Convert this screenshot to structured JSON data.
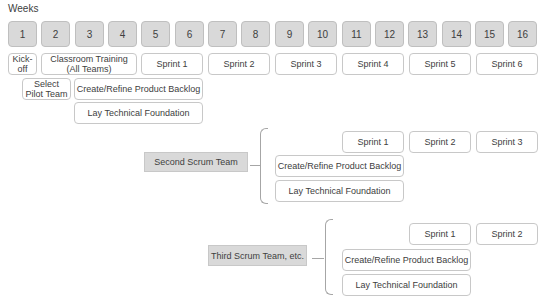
{
  "header": {
    "weeks_label": "Weeks"
  },
  "weeks": [
    "1",
    "2",
    "3",
    "4",
    "5",
    "6",
    "7",
    "8",
    "9",
    "10",
    "11",
    "12",
    "13",
    "14",
    "15",
    "16"
  ],
  "pilot_team": {
    "row1": {
      "kickoff": "Kick-\noff",
      "classroom_training": "Classroom Training\n(All Teams)",
      "sprints": [
        "Sprint 1",
        "Sprint 2",
        "Sprint 3",
        "Sprint 4",
        "Sprint 5",
        "Sprint 6"
      ]
    },
    "select_pilot_team": "Select\nPilot Team",
    "create_refine_backlog": "Create/Refine Product Backlog",
    "lay_technical_foundation": "Lay Technical Foundation"
  },
  "second_team": {
    "label": "Second Scrum Team",
    "sprints": [
      "Sprint 1",
      "Sprint 2",
      "Sprint 3"
    ],
    "create_refine_backlog": "Create/Refine Product Backlog",
    "lay_technical_foundation": "Lay Technical Foundation"
  },
  "third_team": {
    "label": "Third Scrum Team, etc.",
    "sprints": [
      "Sprint 1",
      "Sprint 2"
    ],
    "create_refine_backlog": "Create/Refine Product Backlog",
    "lay_technical_foundation": "Lay Technical Foundation"
  },
  "colors": {
    "week_fill": "#d9d9d9",
    "task_border": "#c8c8c8",
    "text": "#404040",
    "connector": "#a6a6a6"
  }
}
